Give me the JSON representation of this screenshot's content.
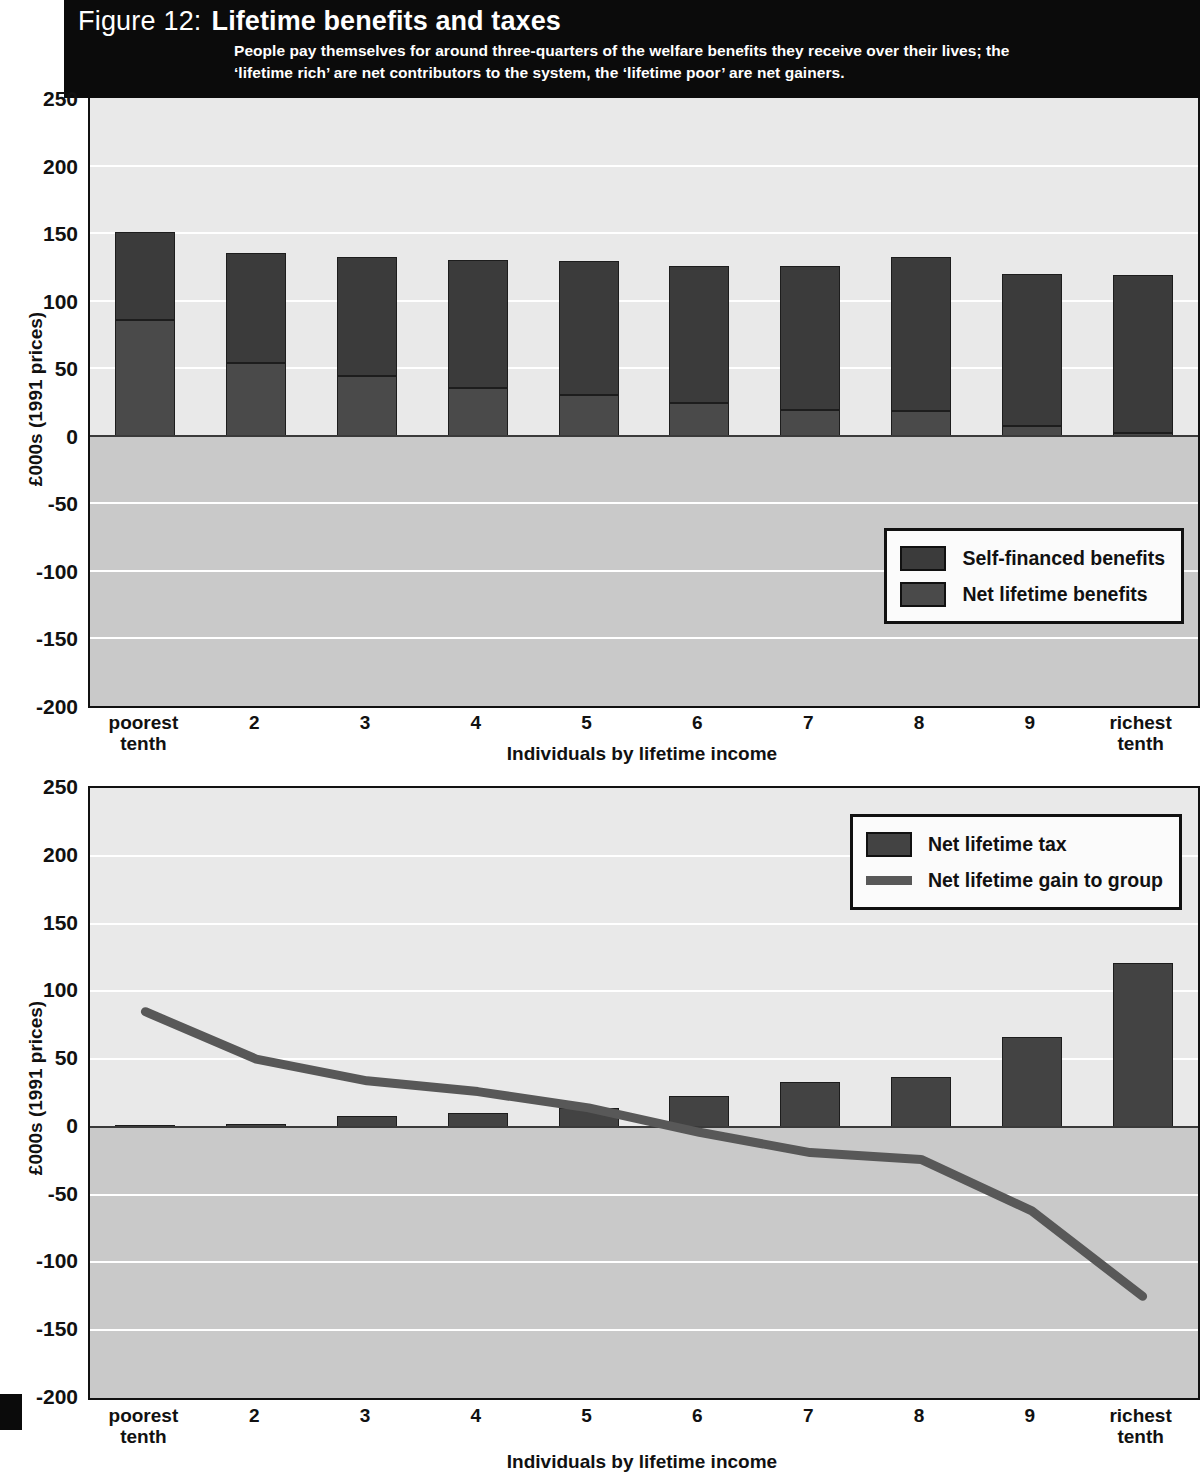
{
  "header": {
    "figure_number": "Figure 12:",
    "title": "Lifetime benefits and taxes",
    "subtitle_line1": "People pay themselves for  around three-quarters of the welfare benefits they receive over their lives; the",
    "subtitle_line2": "‘lifetime rich’ are net contributors to the system, the ‘lifetime poor’ are net gainers."
  },
  "colors": {
    "banner_bg": "#0b0b0b",
    "plot_bg": "#e9e9e9",
    "negative_band": "#c9c9c9",
    "gridline": "#ffffff",
    "self_financed": "#3b3b3b",
    "net_benefits": "#4a4a4a",
    "net_tax": "#434343",
    "gain_line": "#585858",
    "axis": "#111111"
  },
  "chart_data": [
    {
      "id": "chart-benefits",
      "type": "bar",
      "stacked": true,
      "title": "Lifetime benefits and taxes",
      "xlabel": "Individuals by lifetime income",
      "ylabel": "£000s (1991 prices)",
      "ylim": [
        -200,
        250
      ],
      "ytick_values": [
        250,
        200,
        150,
        100,
        50,
        0,
        -50,
        -100,
        -150,
        -200
      ],
      "ytick_labels": [
        "250",
        "200",
        "150",
        "100",
        "50",
        "0",
        "-50",
        "-100",
        "-150",
        "-200"
      ],
      "grid": true,
      "legend_position": "bottom-right",
      "categories": [
        "poorest tenth",
        "2",
        "3",
        "4",
        "5",
        "6",
        "7",
        "8",
        "9",
        "richest tenth"
      ],
      "category_lines": [
        [
          "poorest",
          "tenth"
        ],
        [
          "2"
        ],
        [
          "3"
        ],
        [
          "4"
        ],
        [
          "5"
        ],
        [
          "6"
        ],
        [
          "7"
        ],
        [
          "8"
        ],
        [
          "9"
        ],
        [
          "richest",
          "tenth"
        ]
      ],
      "series": [
        {
          "name": "Net lifetime benefits",
          "values": [
            86,
            54,
            44,
            35,
            30,
            24,
            19,
            18,
            7,
            2
          ]
        },
        {
          "name": "Self-financed benefits",
          "values": [
            65,
            81,
            88,
            95,
            99,
            102,
            107,
            114,
            113,
            117
          ]
        }
      ],
      "totals": [
        151,
        135,
        132,
        130,
        129,
        126,
        126,
        132,
        120,
        119
      ],
      "legend": [
        {
          "label": "Self-financed benefits",
          "marker": "box",
          "color": "#3b3b3b"
        },
        {
          "label": "Net lifetime benefits",
          "marker": "box",
          "color": "#4a4a4a"
        }
      ]
    },
    {
      "id": "chart-taxes",
      "type": "bar",
      "stacked": false,
      "xlabel": "Individuals by lifetime income",
      "ylabel": "£000s (1991 prices)",
      "ylim": [
        -200,
        250
      ],
      "ytick_values": [
        250,
        200,
        150,
        100,
        50,
        0,
        -50,
        -100,
        -150,
        -200
      ],
      "ytick_labels": [
        "250",
        "200",
        "150",
        "100",
        "50",
        "0",
        "-50",
        "-100",
        "-150",
        "-200"
      ],
      "grid": true,
      "legend_position": "top-right",
      "categories": [
        "poorest tenth",
        "2",
        "3",
        "4",
        "5",
        "6",
        "7",
        "8",
        "9",
        "richest tenth"
      ],
      "category_lines": [
        [
          "poorest",
          "tenth"
        ],
        [
          "2"
        ],
        [
          "3"
        ],
        [
          "4"
        ],
        [
          "5"
        ],
        [
          "6"
        ],
        [
          "7"
        ],
        [
          "8"
        ],
        [
          "9"
        ],
        [
          "richest",
          "tenth"
        ]
      ],
      "series": [
        {
          "name": "Net lifetime tax",
          "type": "bar",
          "values": [
            1.5,
            2,
            8,
            10,
            14,
            23,
            33,
            37,
            66,
            121
          ]
        },
        {
          "name": "Net lifetime gain to group",
          "type": "line",
          "values": [
            85,
            50,
            34,
            26,
            14,
            -4,
            -19,
            -24,
            -62,
            -125
          ]
        }
      ],
      "legend": [
        {
          "label": "Net lifetime tax",
          "marker": "box",
          "color": "#434343"
        },
        {
          "label": "Net lifetime gain to group",
          "marker": "line",
          "color": "#585858"
        }
      ]
    }
  ]
}
